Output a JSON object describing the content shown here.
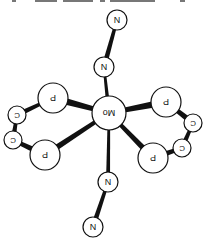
{
  "figure": {
    "orientation": "upside-down",
    "colors": {
      "background": "#ffffff",
      "atom_fill": "#ffffff",
      "atom_stroke": "#111111",
      "bond": "#111111"
    }
  },
  "atoms": [
    {
      "id": "N1",
      "label": "N",
      "x": 117,
      "y": 20,
      "r": 10
    },
    {
      "id": "N2",
      "label": "N",
      "x": 104,
      "y": 67,
      "r": 10
    },
    {
      "id": "Mo",
      "label": "Mo",
      "x": 109,
      "y": 113,
      "r": 17
    },
    {
      "id": "N3",
      "label": "N",
      "x": 108,
      "y": 182,
      "r": 10
    },
    {
      "id": "N4",
      "label": "N",
      "x": 93,
      "y": 227,
      "r": 10
    },
    {
      "id": "P1",
      "label": "P",
      "x": 53,
      "y": 98,
      "r": 15
    },
    {
      "id": "P2",
      "label": "P",
      "x": 45,
      "y": 155,
      "r": 15
    },
    {
      "id": "P3",
      "label": "P",
      "x": 166,
      "y": 102,
      "r": 15
    },
    {
      "id": "P4",
      "label": "P",
      "x": 153,
      "y": 158,
      "r": 15
    },
    {
      "id": "C1",
      "label": "C",
      "x": 17,
      "y": 115,
      "r": 9
    },
    {
      "id": "C2",
      "label": "C",
      "x": 13,
      "y": 140,
      "r": 9
    },
    {
      "id": "C3",
      "label": "C",
      "x": 193,
      "y": 123,
      "r": 9
    },
    {
      "id": "C4",
      "label": "C",
      "x": 182,
      "y": 148,
      "r": 9
    }
  ],
  "bonds": [
    {
      "from": "N1",
      "to": "N2",
      "w": 5
    },
    {
      "from": "N2",
      "to": "Mo",
      "w": 4
    },
    {
      "from": "Mo",
      "to": "N3",
      "w": 4
    },
    {
      "from": "N3",
      "to": "N4",
      "w": 5
    },
    {
      "from": "Mo",
      "to": "P1",
      "w": 7
    },
    {
      "from": "Mo",
      "to": "P2",
      "w": 6
    },
    {
      "from": "Mo",
      "to": "P3",
      "w": 7
    },
    {
      "from": "Mo",
      "to": "P4",
      "w": 6
    },
    {
      "from": "P1",
      "to": "C1",
      "w": 5
    },
    {
      "from": "C1",
      "to": "C2",
      "w": 5
    },
    {
      "from": "C2",
      "to": "P2",
      "w": 6
    },
    {
      "from": "P3",
      "to": "C3",
      "w": 6
    },
    {
      "from": "C3",
      "to": "C4",
      "w": 5
    },
    {
      "from": "C4",
      "to": "P4",
      "w": 6
    }
  ]
}
